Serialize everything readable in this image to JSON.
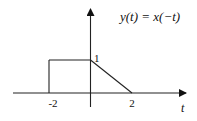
{
  "title": "y(t) = x(−t)",
  "axis_label_x": "t",
  "ticks": {
    "x_neg": "-2",
    "x_pos": "2",
    "y_one": "1"
  },
  "chart_data": {
    "type": "line",
    "title": "y(t) = x(−t)",
    "xlabel": "t",
    "ylabel": "",
    "xlim": [
      -3.3,
      4.2
    ],
    "ylim": [
      -0.5,
      2.5
    ],
    "series": [
      {
        "name": "y(t)",
        "points": [
          [
            -2,
            0
          ],
          [
            -2,
            1
          ],
          [
            0,
            1
          ],
          [
            2,
            0
          ]
        ]
      }
    ],
    "tick_labels": {
      "x": [
        "-2",
        "2"
      ],
      "y": [
        "1"
      ]
    },
    "grid": false
  },
  "colors": {
    "line": "#222222",
    "axis": "#222222"
  }
}
